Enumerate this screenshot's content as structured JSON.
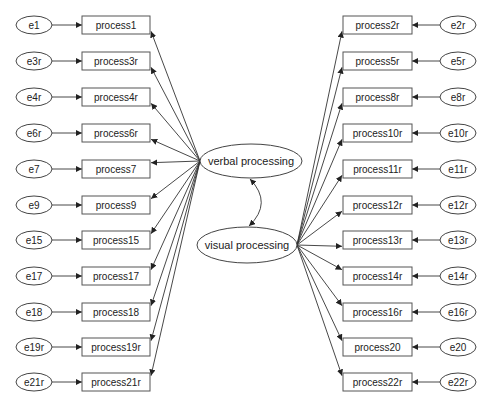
{
  "diagram": {
    "type": "structural-equation-model",
    "latent": {
      "verbal": {
        "label": "verbal processing",
        "cx": 251,
        "cy": 161,
        "rx": 51,
        "ry": 17
      },
      "visual": {
        "label": "visual processing",
        "cx": 247,
        "cy": 245,
        "rx": 50,
        "ry": 18
      }
    },
    "covariance": {
      "between": [
        "verbal processing",
        "visual processing"
      ]
    },
    "left_indicators": [
      {
        "label": "process1",
        "error": "e1",
        "y": 25
      },
      {
        "label": "process3r",
        "error": "e3r",
        "y": 61
      },
      {
        "label": "process4r",
        "error": "e4r",
        "y": 97
      },
      {
        "label": "process6r",
        "error": "e6r",
        "y": 133
      },
      {
        "label": "process7",
        "error": "e7",
        "y": 169
      },
      {
        "label": "process9",
        "error": "e9",
        "y": 205
      },
      {
        "label": "process15",
        "error": "e15",
        "y": 240
      },
      {
        "label": "process17",
        "error": "e17",
        "y": 276
      },
      {
        "label": "process18",
        "error": "e18",
        "y": 312
      },
      {
        "label": "process19r",
        "error": "e19r",
        "y": 347
      },
      {
        "label": "process21r",
        "error": "e21r",
        "y": 382
      }
    ],
    "right_indicators": [
      {
        "label": "process2r",
        "error": "e2r",
        "y": 25
      },
      {
        "label": "process5r",
        "error": "e5r",
        "y": 61
      },
      {
        "label": "process8r",
        "error": "e8r",
        "y": 97
      },
      {
        "label": "process10r",
        "error": "e10r",
        "y": 133
      },
      {
        "label": "process11r",
        "error": "e11r",
        "y": 169
      },
      {
        "label": "process12r",
        "error": "e12r",
        "y": 205
      },
      {
        "label": "process13r",
        "error": "e13r",
        "y": 240
      },
      {
        "label": "process14r",
        "error": "e14r",
        "y": 276
      },
      {
        "label": "process16r",
        "error": "e16r",
        "y": 312
      },
      {
        "label": "process20",
        "error": "e20",
        "y": 347
      },
      {
        "label": "process22r",
        "error": "e22r",
        "y": 382
      }
    ],
    "layout": {
      "left": {
        "err_cx": 34,
        "box_x": 82,
        "box_w": 68
      },
      "right": {
        "err_cx": 458,
        "box_x": 343,
        "box_w": 69
      },
      "err_rx": 18,
      "err_ry": 9,
      "box_h": 18
    },
    "colors": {
      "stroke": "#444444",
      "text": "#222222",
      "background": "#ffffff"
    }
  }
}
